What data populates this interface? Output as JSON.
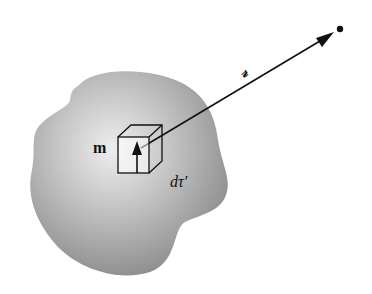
{
  "figure": {
    "labels": {
      "dipole": "m",
      "separation_vector": "𝓇",
      "volume_element": "dτ′"
    },
    "colors": {
      "object_fill_dark": "#8a8a8a",
      "object_fill_light": "#e6e6e6",
      "lines": "#111111",
      "background": "#ffffff"
    }
  }
}
